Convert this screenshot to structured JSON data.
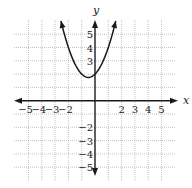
{
  "chart_data": {
    "type": "line",
    "title": "",
    "xlabel": "x",
    "ylabel": "y",
    "xlim": [
      -5,
      5
    ],
    "ylim": [
      -5,
      5
    ],
    "grid": true,
    "x_tick_labels": [
      "−5",
      "−4",
      "−3",
      "−2",
      "2",
      "3",
      "4",
      "5"
    ],
    "x_tick_values": [
      -5,
      -4,
      -3,
      -2,
      2,
      3,
      4,
      5
    ],
    "y_tick_labels": [
      "5",
      "4",
      "3",
      "−2",
      "−3",
      "−4",
      "−5"
    ],
    "y_tick_values": [
      5,
      4,
      3,
      -2,
      -3,
      -4,
      -5
    ],
    "series": [
      {
        "name": "parabola",
        "equation": "y = x^2 + x + 2",
        "vertex": [
          -0.5,
          1.75
        ],
        "x": [
          -2.56,
          -2,
          -1.5,
          -1,
          -0.5,
          0,
          0.5,
          1,
          1.56
        ],
        "y": [
          6.0,
          4.0,
          2.75,
          2.0,
          1.75,
          2.0,
          2.75,
          4.0,
          6.0
        ],
        "arrows_at_ends": true
      }
    ],
    "legend": "none"
  },
  "colors": {
    "ink": "#1a1a1a",
    "grid": "#9a9a9a",
    "background": "#ffffff"
  }
}
